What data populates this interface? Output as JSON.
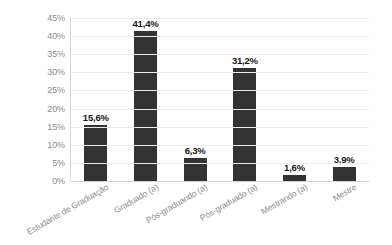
{
  "chart_data": {
    "type": "bar",
    "title": "",
    "xlabel": "",
    "ylabel": "",
    "categories": [
      "Estudante de Graduação",
      "Graduado (a)",
      "Pós-graduando (a)",
      "Pós-graduado (a)",
      "Mestrando (a)",
      "Mestre"
    ],
    "values": [
      15.6,
      41.4,
      6.3,
      31.2,
      1.6,
      3.9
    ],
    "value_labels": [
      "15,6%",
      "41,4%",
      "6,3%",
      "31,2%",
      "1,6%",
      "3,9%"
    ],
    "ylim": [
      0,
      45
    ],
    "ytick_labels": [
      "45%",
      "40%",
      "35%",
      "30%",
      "25%",
      "20%",
      "15%",
      "10%",
      "5%",
      "0%"
    ],
    "ytick_values": [
      45,
      40,
      35,
      30,
      25,
      20,
      15,
      10,
      5,
      0
    ],
    "grid": "horizontal",
    "legend": "none",
    "bar_color": "#333333",
    "gridline_color": "#ebebeb",
    "axis_color": "#d9d9d9",
    "tick_label_color": "#8c8c8c",
    "value_label_color": "#1a1a1a",
    "background_color": "#ffffff",
    "category_label_rotation": -30
  }
}
